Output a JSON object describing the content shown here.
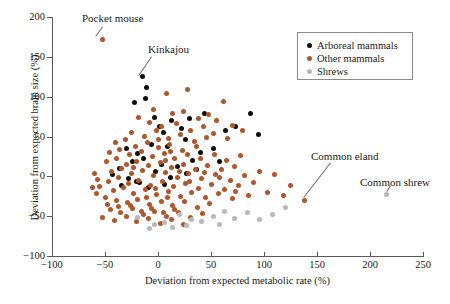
{
  "chart_data": {
    "type": "scatter",
    "title": "",
    "xlabel": "Deviation from expected metabolic rate (%)",
    "ylabel": "Deviation from expected brain size (%)",
    "xlim": [
      -100,
      250
    ],
    "ylim": [
      -100,
      200
    ],
    "xticks": [
      -100,
      -50,
      0,
      50,
      100,
      150,
      200,
      250
    ],
    "yticks": [
      -100,
      -50,
      0,
      50,
      100,
      150,
      200
    ],
    "xtick_labels": [
      "-100",
      "-50",
      "0",
      "50",
      "100",
      "150",
      "200",
      "250"
    ],
    "ytick_labels": [
      "-100",
      "-50",
      "0",
      "50",
      "100",
      "150",
      "200"
    ],
    "grid": false,
    "legend_position": "top-right",
    "colors": {
      "arboreal": "#100d0c",
      "other": "#b0562c",
      "shrew": "#b8b8b8",
      "axis": "#5a5a5a",
      "text": "#1a1a1a"
    },
    "series": [
      {
        "name": "Arboreal mammals",
        "key": "arboreal",
        "color": "#100d0c",
        "points": [
          [
            -15,
            125
          ],
          [
            -11,
            112
          ],
          [
            -12,
            98
          ],
          [
            -22,
            93
          ],
          [
            -3,
            74
          ],
          [
            1,
            62
          ],
          [
            5,
            55
          ],
          [
            13,
            70
          ],
          [
            22,
            60
          ],
          [
            30,
            73
          ],
          [
            44,
            79
          ],
          [
            64,
            58
          ],
          [
            73,
            62
          ],
          [
            87,
            79
          ],
          [
            95,
            52
          ],
          [
            -30,
            35
          ],
          [
            -19,
            29
          ],
          [
            -6,
            40
          ],
          [
            9,
            38
          ],
          [
            26,
            46
          ],
          [
            40,
            30
          ],
          [
            52,
            35
          ],
          [
            -36,
            10
          ],
          [
            -24,
            18
          ],
          [
            -14,
            22
          ],
          [
            3,
            15
          ],
          [
            18,
            12
          ],
          [
            33,
            20
          ],
          [
            -43,
            2
          ],
          [
            -28,
            -3
          ],
          [
            -17,
            -8
          ],
          [
            -2,
            6
          ],
          [
            12,
            -2
          ],
          [
            27,
            4
          ],
          [
            -34,
            -12
          ],
          [
            -9,
            -14
          ],
          [
            6,
            -10
          ],
          [
            -20,
            -6
          ],
          [
            36,
            8
          ],
          [
            58,
            18
          ]
        ]
      },
      {
        "name": "Other mammals",
        "key": "other",
        "color": "#b0562c",
        "points": [
          [
            -52,
            172
          ],
          [
            8,
            104
          ],
          [
            28,
            109
          ],
          [
            62,
            94
          ],
          [
            -4,
            84
          ],
          [
            14,
            79
          ],
          [
            24,
            81
          ],
          [
            38,
            72
          ],
          [
            48,
            77
          ],
          [
            55,
            70
          ],
          [
            70,
            64
          ],
          [
            80,
            57
          ],
          [
            -18,
            74
          ],
          [
            -8,
            67
          ],
          [
            3,
            63
          ],
          [
            17,
            66
          ],
          [
            31,
            58
          ],
          [
            43,
            62
          ],
          [
            52,
            54
          ],
          [
            66,
            47
          ],
          [
            -25,
            55
          ],
          [
            -13,
            50
          ],
          [
            -1,
            57
          ],
          [
            10,
            48
          ],
          [
            21,
            52
          ],
          [
            34,
            44
          ],
          [
            46,
            49
          ],
          [
            -40,
            42
          ],
          [
            -31,
            46
          ],
          [
            -21,
            38
          ],
          [
            -10,
            42
          ],
          [
            0,
            36
          ],
          [
            11,
            40
          ],
          [
            23,
            33
          ],
          [
            36,
            38
          ],
          [
            -46,
            30
          ],
          [
            -36,
            34
          ],
          [
            -27,
            27
          ],
          [
            -16,
            31
          ],
          [
            -5,
            25
          ],
          [
            6,
            29
          ],
          [
            16,
            23
          ],
          [
            28,
            27
          ],
          [
            40,
            22
          ],
          [
            53,
            28
          ],
          [
            65,
            20
          ],
          [
            78,
            26
          ],
          [
            -49,
            18
          ],
          [
            -39,
            22
          ],
          [
            -30,
            15
          ],
          [
            -20,
            19
          ],
          [
            -9,
            13
          ],
          [
            2,
            17
          ],
          [
            13,
            11
          ],
          [
            24,
            15
          ],
          [
            35,
            9
          ],
          [
            47,
            14
          ],
          [
            60,
            8
          ],
          [
            72,
            12
          ],
          [
            -44,
            6
          ],
          [
            -34,
            10
          ],
          [
            -25,
            3
          ],
          [
            -15,
            7
          ],
          [
            -4,
            1
          ],
          [
            7,
            5
          ],
          [
            18,
            -1
          ],
          [
            29,
            3
          ],
          [
            41,
            -3
          ],
          [
            54,
            2
          ],
          [
            68,
            -5
          ],
          [
            82,
            1
          ],
          [
            -47,
            -6
          ],
          [
            -37,
            -2
          ],
          [
            -28,
            -9
          ],
          [
            -18,
            -5
          ],
          [
            -7,
            -11
          ],
          [
            4,
            -7
          ],
          [
            15,
            -13
          ],
          [
            26,
            -9
          ],
          [
            38,
            -15
          ],
          [
            50,
            -10
          ],
          [
            63,
            -17
          ],
          [
            76,
            -12
          ],
          [
            -42,
            -18
          ],
          [
            -33,
            -14
          ],
          [
            -23,
            -21
          ],
          [
            -12,
            -17
          ],
          [
            -1,
            -23
          ],
          [
            10,
            -19
          ],
          [
            21,
            -25
          ],
          [
            32,
            -20
          ],
          [
            45,
            -27
          ],
          [
            57,
            -22
          ],
          [
            70,
            -28
          ],
          [
            85,
            -24
          ],
          [
            -55,
            -13
          ],
          [
            -50,
            -26
          ],
          [
            -39,
            -30
          ],
          [
            -29,
            -33
          ],
          [
            -19,
            -29
          ],
          [
            -8,
            -35
          ],
          [
            3,
            -31
          ],
          [
            14,
            -37
          ],
          [
            25,
            -32
          ],
          [
            37,
            -39
          ],
          [
            49,
            -34
          ],
          [
            -58,
            -21
          ],
          [
            -45,
            -42
          ],
          [
            -35,
            -46
          ],
          [
            -24,
            -41
          ],
          [
            -14,
            -48
          ],
          [
            -3,
            -44
          ],
          [
            8,
            -50
          ],
          [
            19,
            -45
          ],
          [
            31,
            -52
          ],
          [
            42,
            -47
          ],
          [
            -52,
            -52
          ],
          [
            -41,
            -55
          ],
          [
            -30,
            -50
          ],
          [
            -20,
            -57
          ],
          [
            -9,
            -53
          ],
          [
            2,
            -59
          ],
          [
            13,
            -54
          ],
          [
            24,
            -60
          ],
          [
            -16,
            -44
          ],
          [
            -6,
            -40
          ],
          [
            5,
            -46
          ],
          [
            16,
            -42
          ],
          [
            -26,
            -37
          ],
          [
            -37,
            -38
          ],
          [
            -48,
            -35
          ],
          [
            90,
            -8
          ],
          [
            96,
            6
          ],
          [
            103,
            -20
          ],
          [
            110,
            2
          ],
          [
            118,
            -24
          ],
          [
            125,
            -12
          ],
          [
            138,
            -30
          ],
          [
            -60,
            4
          ],
          [
            -57,
            -4
          ],
          [
            -62,
            -14
          ],
          [
            0,
            46
          ],
          [
            -11,
            -27
          ],
          [
            9,
            -26
          ],
          [
            20,
            6
          ],
          [
            30,
            -6
          ],
          [
            44,
            5
          ],
          [
            58,
            -2
          ],
          [
            73,
            -19
          ],
          [
            -2,
            -15
          ],
          [
            7,
            20
          ],
          [
            -23,
            11
          ],
          [
            12,
            31
          ]
        ]
      },
      {
        "name": "Shrews",
        "key": "shrew",
        "color": "#b8b8b8",
        "points": [
          [
            -19,
            -52
          ],
          [
            -8,
            -66
          ],
          [
            6,
            -58
          ],
          [
            20,
            -48
          ],
          [
            32,
            -54
          ],
          [
            41,
            -57
          ],
          [
            52,
            -50
          ],
          [
            63,
            -44
          ],
          [
            72,
            -53
          ],
          [
            84,
            -46
          ],
          [
            96,
            -54
          ],
          [
            108,
            -48
          ],
          [
            120,
            -39
          ],
          [
            216,
            -23
          ],
          [
            27,
            -62
          ],
          [
            14,
            -64
          ],
          [
            -3,
            -60
          ],
          [
            58,
            -60
          ]
        ]
      }
    ],
    "annotations": [
      {
        "label": "Pocket mouse",
        "label_left": 82,
        "label_top": 12,
        "point_x": -52,
        "point_y": 172,
        "leader": {
          "x1": 103,
          "y1": 27,
          "x2": 96,
          "y2": 37
        }
      },
      {
        "label": "Kinkajou",
        "label_left": 148,
        "label_top": 43,
        "point_x": -15,
        "point_y": 125,
        "leader": {
          "x1": 152,
          "y1": 57,
          "x2": 139,
          "y2": 76
        }
      },
      {
        "label": "Common eland",
        "label_left": 311,
        "label_top": 150,
        "point_x": 138,
        "point_y": -30,
        "leader": {
          "x1": 331,
          "y1": 163,
          "x2": 304,
          "y2": 198
        }
      },
      {
        "label": "Common shrew",
        "label_left": 360,
        "label_top": 176,
        "point_x": 216,
        "point_y": -23,
        "leader": {
          "x1": 391,
          "y1": 186,
          "x2": 387,
          "y2": 192
        }
      }
    ]
  },
  "legend": {
    "items": [
      {
        "label": "Arboreal mammals",
        "color": "#100d0c"
      },
      {
        "label": "Other mammals",
        "color": "#b0562c"
      },
      {
        "label": "Shrews",
        "color": "#b8b8b8"
      }
    ]
  }
}
